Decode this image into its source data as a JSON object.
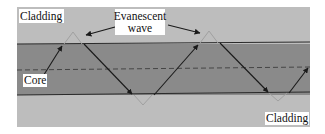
{
  "diagram": {
    "labels": {
      "cladding_top": "Cladding",
      "cladding_bottom": "Cladding",
      "core": "Core",
      "evanescent_line1": "Evanescent",
      "evanescent_line2": "wave"
    },
    "colors": {
      "cladding": "#bdbdbd",
      "core": "#8a8a8a",
      "ray": "#1a1a1a",
      "evanescent": "#9a9a9a",
      "boundary": "#2a2a2a"
    }
  }
}
